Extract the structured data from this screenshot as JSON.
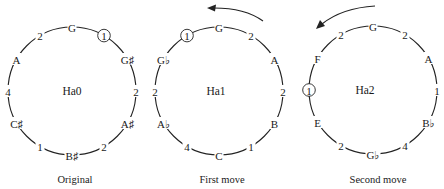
{
  "figure": {
    "panels": [
      {
        "id": "ha0",
        "center_label": "Ha0",
        "caption": "Original",
        "cx": 72,
        "cy": 91,
        "r": 64,
        "arrow": null,
        "nodes": [
          "G",
          "1",
          "G♯",
          "2",
          "A♯",
          "2",
          "B♯",
          "1",
          "C♯",
          "4",
          "A",
          "2"
        ],
        "circled_index": 1
      },
      {
        "id": "ha1",
        "center_label": "Ha1",
        "caption": "First move",
        "cx": 219,
        "cy": 91,
        "r": 64,
        "arrow": "counterclockwise",
        "nodes": [
          "G",
          "2",
          "A",
          "2",
          "B",
          "1",
          "C",
          "4",
          "A♭",
          "2",
          "G♭",
          "1"
        ],
        "circled_index": 11
      },
      {
        "id": "ha2",
        "center_label": "Ha2",
        "caption": "Second move",
        "cx": 373,
        "cy": 90,
        "r": 64,
        "arrow": "counterclockwise",
        "nodes": [
          "G",
          "2",
          "A",
          "1",
          "B♭",
          "4",
          "G♭",
          "2",
          "E",
          "1",
          "F",
          "2"
        ],
        "circled_index": 9
      }
    ]
  }
}
